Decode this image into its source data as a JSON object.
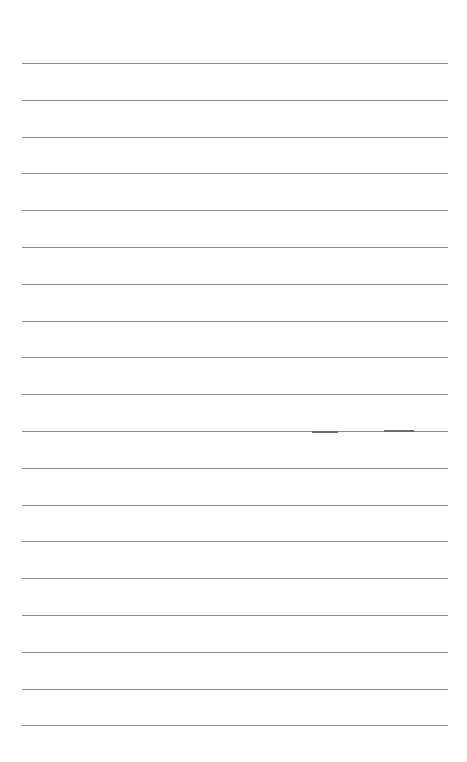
{
  "page": {
    "type": "lined-paper",
    "background": "#ffffff",
    "rule_color": "#8a8a8a",
    "rule_count": 19,
    "first_rule_y": 63,
    "rule_spacing": 36.8,
    "rule_left": 22,
    "rule_width": 426
  },
  "marks": [
    {
      "x": 312,
      "y": 431,
      "width": 26
    },
    {
      "x": 384,
      "y": 430,
      "width": 30
    }
  ]
}
